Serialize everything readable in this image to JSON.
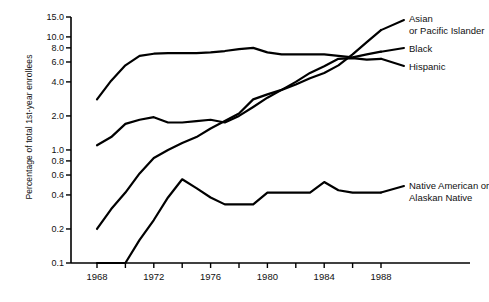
{
  "chart_data": {
    "type": "line",
    "title": "",
    "xlabel": "",
    "ylabel": "Percentage of total 1st-year enrollees",
    "yscale": "log",
    "ylim": [
      0.1,
      15.0
    ],
    "xlim": [
      1967,
      1989
    ],
    "grid": false,
    "legend_position": "right-inline",
    "ytick_labels": [
      "15.0",
      "10.0",
      "8.0",
      "6.0",
      "4.0",
      "2.0",
      "1.0",
      "0.8",
      "0.6",
      "0.4",
      "0.2",
      "0.1"
    ],
    "ytick_values": [
      15.0,
      10.0,
      8.0,
      6.0,
      4.0,
      2.0,
      1.0,
      0.8,
      0.6,
      0.4,
      0.2,
      0.1
    ],
    "xtick_labels": [
      "1968",
      "1972",
      "1976",
      "1980",
      "1984",
      "1988"
    ],
    "xtick_values": [
      1968,
      1972,
      1976,
      1980,
      1984,
      1988
    ],
    "xminor_ticks": [
      1970,
      1974,
      1978,
      1982,
      1986
    ],
    "x": [
      1968,
      1969,
      1970,
      1971,
      1972,
      1973,
      1974,
      1975,
      1976,
      1977,
      1978,
      1979,
      1980,
      1981,
      1982,
      1983,
      1984,
      1985,
      1986,
      1987,
      1988
    ],
    "series": [
      {
        "name": "Asian or Pacific Islander",
        "label_lines": [
          "Asian",
          "or Pacific Islander"
        ],
        "values": [
          0.2,
          0.3,
          0.42,
          0.62,
          0.85,
          1.0,
          1.15,
          1.3,
          1.55,
          1.8,
          2.1,
          2.8,
          3.1,
          3.4,
          3.8,
          4.3,
          4.8,
          5.6,
          7.0,
          9.0,
          11.5
        ]
      },
      {
        "name": "Black",
        "label_lines": [
          "Black"
        ],
        "values": [
          2.8,
          4.1,
          5.6,
          6.8,
          7.1,
          7.2,
          7.2,
          7.2,
          7.3,
          7.5,
          7.8,
          8.0,
          7.3,
          7.0,
          7.0,
          7.0,
          7.0,
          6.8,
          6.6,
          7.0,
          7.4
        ]
      },
      {
        "name": "Hispanic",
        "label_lines": [
          "Hispanic"
        ],
        "values": [
          1.1,
          1.3,
          1.7,
          1.85,
          1.95,
          1.75,
          1.75,
          1.8,
          1.85,
          1.75,
          2.0,
          2.4,
          2.9,
          3.4,
          4.0,
          4.8,
          5.5,
          6.4,
          6.5,
          6.3,
          6.4
        ]
      },
      {
        "name": "Native American or Alaskan Native",
        "label_lines": [
          "Native American or",
          "Alaskan Native"
        ],
        "values": [
          0.1,
          0.1,
          0.1,
          0.16,
          0.24,
          0.38,
          0.55,
          0.46,
          0.38,
          0.33,
          0.33,
          0.33,
          0.42,
          0.42,
          0.42,
          0.42,
          0.52,
          0.44,
          0.42,
          0.42,
          0.42
        ]
      }
    ]
  },
  "axis": {
    "y_title": "Percentage of total 1st-year enrollees"
  },
  "labels": {
    "asian_line1": "Asian",
    "asian_line2": "or Pacific Islander",
    "black": "Black",
    "hispanic": "Hispanic",
    "native_line1": "Native American or",
    "native_line2": "Alaskan Native"
  },
  "colors": {
    "line": "#000000",
    "axis": "#000000",
    "background": "#ffffff"
  }
}
